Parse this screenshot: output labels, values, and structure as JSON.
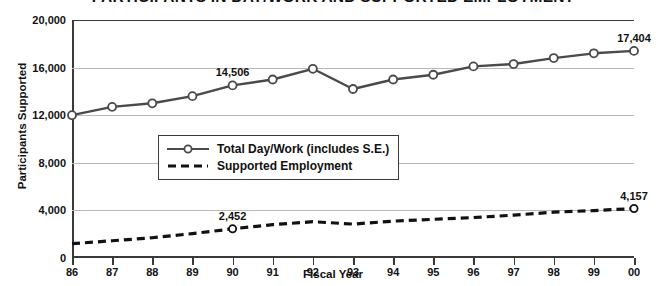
{
  "chart_data": {
    "type": "line",
    "title": "PARTICIPANTS IN DAY/WORK AND SUPPORTED EMPLOYMENT",
    "xlabel": "Fiscal Year",
    "ylabel": "Participants Supported",
    "categories": [
      "86",
      "87",
      "88",
      "89",
      "90",
      "91",
      "92",
      "93",
      "94",
      "95",
      "96",
      "97",
      "98",
      "99",
      "00"
    ],
    "ylim": [
      0,
      20000
    ],
    "ytick_labels": [
      "0",
      "4,000",
      "8,000",
      "12,000",
      "16,000",
      "20,000"
    ],
    "ytick_values": [
      0,
      4000,
      8000,
      12000,
      16000,
      20000
    ],
    "grid": true,
    "legend_position": "inside-upper-left",
    "series": [
      {
        "name": "Total Day/Work (includes S.E.)",
        "style": "solid",
        "marker": "open-circle",
        "color": "#4a4a4a",
        "values": [
          12000,
          12700,
          13000,
          13600,
          14506,
          15000,
          15900,
          14200,
          15000,
          15400,
          16100,
          16300,
          16800,
          17200,
          17404
        ]
      },
      {
        "name": "Supported Employment",
        "style": "dashed",
        "marker": "none",
        "color": "#111111",
        "values": [
          1200,
          1450,
          1700,
          2050,
          2452,
          2800,
          3050,
          2850,
          3100,
          3250,
          3400,
          3600,
          3850,
          3980,
          4157
        ]
      }
    ],
    "annotations": [
      {
        "series": "Total Day/Work (includes S.E.)",
        "category": "90",
        "value": 14506,
        "text": "14,506"
      },
      {
        "series": "Total Day/Work (includes S.E.)",
        "category": "00",
        "value": 17404,
        "text": "17,404"
      },
      {
        "series": "Supported Employment",
        "category": "90",
        "value": 2452,
        "text": "2,452"
      },
      {
        "series": "Supported Employment",
        "category": "00",
        "value": 4157,
        "text": "4,157"
      }
    ]
  },
  "legend": {
    "items": [
      {
        "label": "Total Day/Work (includes S.E.)"
      },
      {
        "label": "Supported Employment"
      }
    ]
  }
}
